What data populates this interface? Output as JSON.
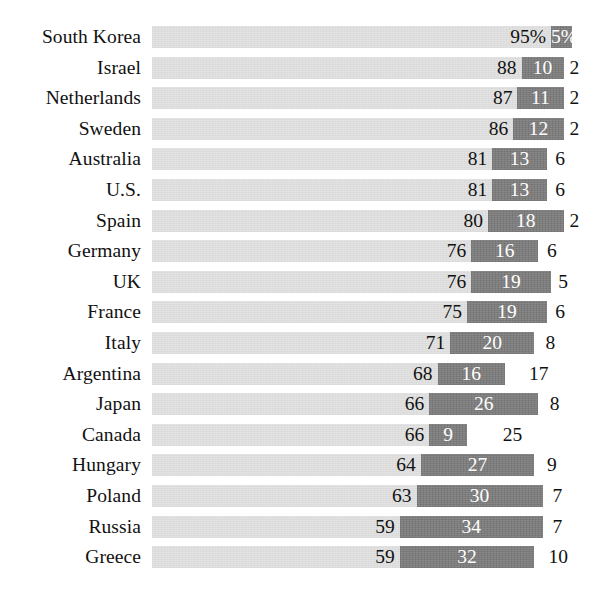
{
  "chart_data": {
    "type": "bar",
    "subtype": "stacked-horizontal-bar",
    "title": "",
    "subtitle": "",
    "xlabel": "",
    "ylabel": "",
    "xlim": [
      0,
      100
    ],
    "grid": false,
    "legend_position": "none",
    "unit": "%",
    "first_row_suffix": "%",
    "categories": [
      "South Korea",
      "Israel",
      "Netherlands",
      "Sweden",
      "Australia",
      "U.S.",
      "Spain",
      "Germany",
      "UK",
      "France",
      "Italy",
      "Argentina",
      "Japan",
      "Canada",
      "Hungary",
      "Poland",
      "Russia",
      "Greece"
    ],
    "series": [
      {
        "name": "segment-a",
        "color": "#e2e2e2",
        "label_color": "#111111",
        "values": [
          95,
          88,
          87,
          86,
          81,
          81,
          80,
          76,
          76,
          75,
          71,
          68,
          66,
          66,
          64,
          63,
          59,
          59
        ]
      },
      {
        "name": "segment-b",
        "color": "#7e7e7e",
        "label_color": "#ffffff",
        "values": [
          5,
          10,
          11,
          12,
          13,
          13,
          18,
          16,
          19,
          19,
          20,
          16,
          26,
          9,
          27,
          30,
          34,
          32
        ]
      },
      {
        "name": "segment-c",
        "color": "none",
        "label_color": "#111111",
        "values": [
          null,
          2,
          2,
          2,
          6,
          6,
          2,
          6,
          5,
          6,
          8,
          17,
          8,
          25,
          9,
          7,
          7,
          10
        ]
      }
    ],
    "rows": [
      {
        "label": "South Korea",
        "a": 95,
        "a_text": "95%",
        "b": 5,
        "b_text": "5%",
        "c": null,
        "c_text": ""
      },
      {
        "label": "Israel",
        "a": 88,
        "a_text": "88",
        "b": 10,
        "b_text": "10",
        "c": 2,
        "c_text": "2"
      },
      {
        "label": "Netherlands",
        "a": 87,
        "a_text": "87",
        "b": 11,
        "b_text": "11",
        "c": 2,
        "c_text": "2"
      },
      {
        "label": "Sweden",
        "a": 86,
        "a_text": "86",
        "b": 12,
        "b_text": "12",
        "c": 2,
        "c_text": "2"
      },
      {
        "label": "Australia",
        "a": 81,
        "a_text": "81",
        "b": 13,
        "b_text": "13",
        "c": 6,
        "c_text": "6"
      },
      {
        "label": "U.S.",
        "a": 81,
        "a_text": "81",
        "b": 13,
        "b_text": "13",
        "c": 6,
        "c_text": "6"
      },
      {
        "label": "Spain",
        "a": 80,
        "a_text": "80",
        "b": 18,
        "b_text": "18",
        "c": 2,
        "c_text": "2"
      },
      {
        "label": "Germany",
        "a": 76,
        "a_text": "76",
        "b": 16,
        "b_text": "16",
        "c": 6,
        "c_text": "6"
      },
      {
        "label": "UK",
        "a": 76,
        "a_text": "76",
        "b": 19,
        "b_text": "19",
        "c": 5,
        "c_text": "5"
      },
      {
        "label": "France",
        "a": 75,
        "a_text": "75",
        "b": 19,
        "b_text": "19",
        "c": 6,
        "c_text": "6"
      },
      {
        "label": "Italy",
        "a": 71,
        "a_text": "71",
        "b": 20,
        "b_text": "20",
        "c": 8,
        "c_text": "8"
      },
      {
        "label": "Argentina",
        "a": 68,
        "a_text": "68",
        "b": 16,
        "b_text": "16",
        "c": 17,
        "c_text": "17"
      },
      {
        "label": "Japan",
        "a": 66,
        "a_text": "66",
        "b": 26,
        "b_text": "26",
        "c": 8,
        "c_text": "8"
      },
      {
        "label": "Canada",
        "a": 66,
        "a_text": "66",
        "b": 9,
        "b_text": "9",
        "c": 25,
        "c_text": "25"
      },
      {
        "label": "Hungary",
        "a": 64,
        "a_text": "64",
        "b": 27,
        "b_text": "27",
        "c": 9,
        "c_text": "9"
      },
      {
        "label": "Poland",
        "a": 63,
        "a_text": "63",
        "b": 30,
        "b_text": "30",
        "c": 7,
        "c_text": "7"
      },
      {
        "label": "Russia",
        "a": 59,
        "a_text": "59",
        "b": 34,
        "b_text": "34",
        "c": 7,
        "c_text": "7"
      },
      {
        "label": "Greece",
        "a": 59,
        "a_text": "59",
        "b": 32,
        "b_text": "32",
        "c": 10,
        "c_text": "10"
      }
    ]
  },
  "layout": {
    "track_left_px": 152,
    "track_width_px": 420,
    "row_pitch_px": 30.6,
    "row_top_px": 22,
    "bar_height_px": 22
  }
}
